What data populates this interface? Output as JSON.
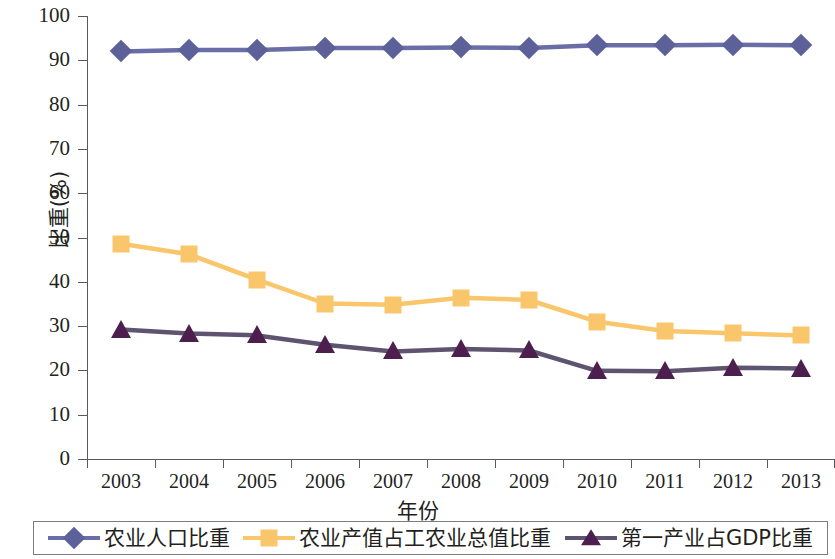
{
  "chart_data": {
    "type": "line",
    "title": "",
    "xlabel": "年份",
    "ylabel": "比重(%)",
    "categories": [
      "2003",
      "2004",
      "2005",
      "2006",
      "2007",
      "2008",
      "2009",
      "2010",
      "2011",
      "2012",
      "2013"
    ],
    "x": [
      2003,
      2004,
      2005,
      2006,
      2007,
      2008,
      2009,
      2010,
      2011,
      2012,
      2013
    ],
    "ylim": [
      0,
      100
    ],
    "yticks": [
      0,
      10,
      20,
      30,
      40,
      50,
      60,
      70,
      80,
      90,
      100
    ],
    "ytick_labels": [
      "0",
      "10",
      "20",
      "30",
      "40",
      "50",
      "60",
      "70",
      "80",
      "90",
      "100"
    ],
    "grid": false,
    "legend_position": "bottom",
    "series": [
      {
        "name": "农业人口比重",
        "marker": "diamond",
        "color": "#5d6199",
        "line_color": "#6a6ea6",
        "values": [
          92.0,
          92.3,
          92.3,
          92.8,
          92.8,
          92.9,
          92.8,
          93.4,
          93.4,
          93.5,
          93.4
        ]
      },
      {
        "name": "农业产值占工农业总值比重",
        "marker": "square",
        "color": "#f9c66c",
        "line_color": "#f9c66c",
        "values": [
          48.6,
          46.2,
          40.5,
          35.1,
          34.8,
          36.4,
          35.9,
          31.0,
          28.9,
          28.4,
          27.9
        ]
      },
      {
        "name": "第一产业占GDP比重",
        "marker": "triangle",
        "color": "#4d1f4f",
        "line_color": "#5f5470",
        "values": [
          29.2,
          28.3,
          27.9,
          25.8,
          24.3,
          24.8,
          24.5,
          19.9,
          19.8,
          20.6,
          20.4
        ]
      }
    ]
  }
}
